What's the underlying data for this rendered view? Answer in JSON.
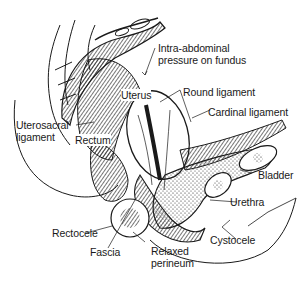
{
  "figure": {
    "labels": {
      "intra_abdominal_line1": "Intra-abdominal",
      "intra_abdominal_line2": "pressure on fundus",
      "uterus": "Uterus",
      "round_ligament": "Round ligament",
      "cardinal_ligament": "Cardinal ligament",
      "uterosacral_line1": "Uterosacral",
      "uterosacral_line2": "ligament",
      "rectum": "Rectum",
      "bladder": "Bladder",
      "urethra": "Urethra",
      "rectocele": "Rectocele",
      "cystocele": "Cystocele",
      "fascia": "Fascia",
      "relaxed_line1": "Relaxed",
      "relaxed_line2": "perineum"
    },
    "colors": {
      "ink": "#1a1a1a",
      "background": "#ffffff"
    }
  }
}
